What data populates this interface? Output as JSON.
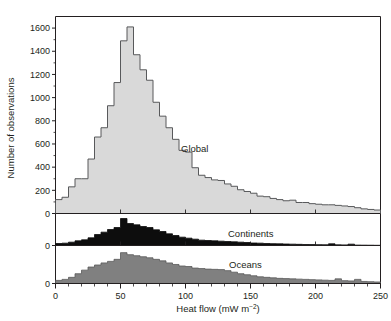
{
  "figure": {
    "xlabel_main": "Heat flow (mW m",
    "xlabel_sup": "−2",
    "xlabel_close": ")",
    "ylabel": "Number of observations"
  },
  "axes": {
    "x_ticks": [
      "0",
      "50",
      "100",
      "150",
      "200",
      "250"
    ],
    "y_ticks_global": [
      "0",
      "200",
      "400",
      "600",
      "800",
      "1000",
      "1200",
      "1400",
      "1600"
    ],
    "y_ticks_continents": [
      "0"
    ],
    "y_ticks_oceans": [
      "0"
    ]
  },
  "chart_data": {
    "type": "bar",
    "title": "",
    "xlabel": "Heat flow (mW m−2)",
    "ylabel": "Number of observations",
    "xlim": [
      0,
      250
    ],
    "bin_width": 5,
    "grid": false,
    "legend_position": "inline-annotation",
    "panels": [
      {
        "name": "Global",
        "label": "Global",
        "fill_color": "#d9d9d9",
        "stroke_color": "#58595b",
        "ylim": [
          0,
          1700
        ],
        "ytick_step": 200,
        "ytick_max_labeled": 1600,
        "bin_centers": [
          2.5,
          7.5,
          12.5,
          17.5,
          22.5,
          27.5,
          32.5,
          37.5,
          42.5,
          47.5,
          52.5,
          57.5,
          62.5,
          67.5,
          72.5,
          77.5,
          82.5,
          87.5,
          92.5,
          97.5,
          102.5,
          107.5,
          112.5,
          117.5,
          122.5,
          127.5,
          132.5,
          137.5,
          142.5,
          147.5,
          152.5,
          157.5,
          162.5,
          167.5,
          172.5,
          177.5,
          182.5,
          187.5,
          192.5,
          197.5,
          202.5,
          207.5,
          212.5,
          217.5,
          222.5,
          227.5,
          232.5,
          237.5,
          242.5,
          247.5
        ],
        "values": [
          120,
          140,
          230,
          300,
          300,
          470,
          660,
          740,
          930,
          1130,
          1490,
          1610,
          1370,
          1240,
          1150,
          960,
          840,
          740,
          640,
          545,
          530,
          395,
          330,
          310,
          290,
          285,
          255,
          235,
          205,
          190,
          175,
          150,
          145,
          130,
          120,
          110,
          115,
          95,
          95,
          85,
          80,
          75,
          75,
          70,
          65,
          60,
          50,
          40,
          35,
          30
        ]
      },
      {
        "name": "Continents",
        "label": "Continents",
        "fill_color": "#0d0d0d",
        "stroke_color": "#0d0d0d",
        "ylim": [
          0,
          900
        ],
        "ytick_step": 0,
        "bin_centers": [
          2.5,
          7.5,
          12.5,
          17.5,
          22.5,
          27.5,
          32.5,
          37.5,
          42.5,
          47.5,
          52.5,
          57.5,
          62.5,
          67.5,
          72.5,
          77.5,
          82.5,
          87.5,
          92.5,
          97.5,
          102.5,
          107.5,
          112.5,
          117.5,
          122.5,
          127.5,
          132.5,
          137.5,
          142.5,
          147.5,
          152.5,
          157.5,
          162.5,
          167.5,
          172.5,
          177.5,
          182.5,
          187.5,
          192.5,
          197.5,
          202.5,
          207.5,
          212.5,
          217.5,
          222.5,
          227.5,
          232.5,
          237.5,
          242.5,
          247.5
        ],
        "values": [
          60,
          70,
          100,
          140,
          170,
          230,
          330,
          400,
          480,
          540,
          810,
          660,
          620,
          570,
          540,
          470,
          420,
          350,
          300,
          250,
          220,
          190,
          160,
          150,
          140,
          130,
          120,
          110,
          100,
          90,
          75,
          70,
          60,
          55,
          50,
          45,
          40,
          35,
          30,
          28,
          25,
          22,
          50,
          20,
          18,
          40,
          12,
          10,
          8,
          6
        ]
      },
      {
        "name": "Oceans",
        "label": "Oceans",
        "fill_color": "#808080",
        "stroke_color": "#595959",
        "ylim": [
          0,
          700
        ],
        "ytick_step": 0,
        "bin_centers": [
          2.5,
          7.5,
          12.5,
          17.5,
          22.5,
          27.5,
          32.5,
          37.5,
          42.5,
          47.5,
          52.5,
          57.5,
          62.5,
          67.5,
          72.5,
          77.5,
          82.5,
          87.5,
          92.5,
          97.5,
          102.5,
          107.5,
          112.5,
          117.5,
          122.5,
          127.5,
          132.5,
          137.5,
          142.5,
          147.5,
          152.5,
          157.5,
          162.5,
          167.5,
          172.5,
          177.5,
          182.5,
          187.5,
          192.5,
          197.5,
          202.5,
          207.5,
          212.5,
          217.5,
          222.5,
          227.5,
          232.5,
          237.5,
          242.5,
          247.5
        ],
        "values": [
          60,
          80,
          120,
          190,
          260,
          320,
          360,
          400,
          430,
          470,
          600,
          560,
          540,
          520,
          500,
          470,
          440,
          400,
          370,
          340,
          330,
          300,
          290,
          280,
          275,
          270,
          250,
          220,
          190,
          170,
          150,
          130,
          120,
          110,
          100,
          95,
          90,
          85,
          80,
          75,
          70,
          65,
          60,
          90,
          55,
          50,
          80,
          40,
          35,
          30
        ]
      }
    ]
  }
}
